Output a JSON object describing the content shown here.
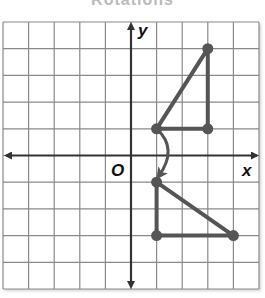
{
  "title": "Rotations",
  "chart_data": {
    "type": "coordinate-grid",
    "title": "Rotations",
    "xlabel": "x",
    "ylabel": "y",
    "origin_label": "O",
    "xlim": [
      -5,
      5
    ],
    "ylim": [
      -5,
      5
    ],
    "grid": true,
    "figures": [
      {
        "name": "preimage-triangle",
        "vertices": [
          [
            1,
            1
          ],
          [
            3,
            1
          ],
          [
            3,
            4
          ]
        ]
      },
      {
        "name": "image-triangle",
        "vertices": [
          [
            1,
            -1
          ],
          [
            1,
            -3
          ],
          [
            4,
            -3
          ]
        ]
      }
    ],
    "annotations": [
      {
        "type": "curved-arrow",
        "from": [
          1,
          1
        ],
        "to": [
          1,
          -1
        ],
        "meaning": "90° clockwise rotation about origin"
      }
    ]
  },
  "labels": {
    "x_axis": "x",
    "y_axis": "y",
    "origin": "O"
  },
  "colors": {
    "grid": "#8a8a8a",
    "axes": "#333333",
    "figure": "#555555"
  }
}
